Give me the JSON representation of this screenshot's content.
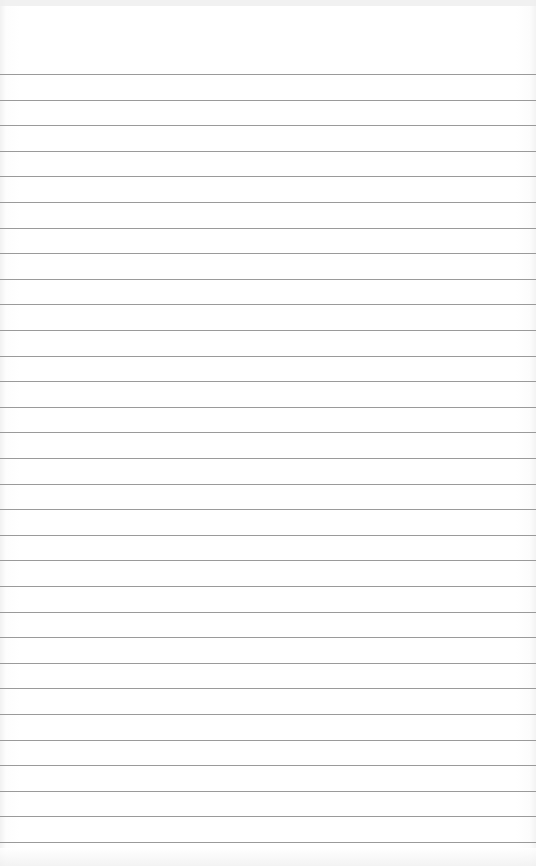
{
  "page": {
    "type": "lined-paper",
    "rule_count": 31,
    "colors": {
      "paper": "#ffffff",
      "rule": "#9a9a9a"
    }
  }
}
